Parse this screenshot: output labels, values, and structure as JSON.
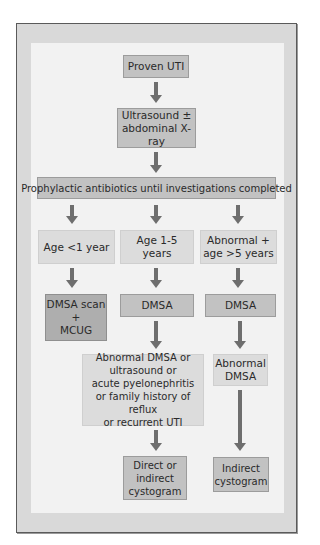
{
  "caption": "",
  "flowchart": {
    "colors": {
      "frame": "#d9d9d9",
      "panel": "#f2f2f2",
      "box_mid": "#c2c2c2",
      "box_light": "#dcdcdc",
      "box_dark": "#aeaeae",
      "arrow": "#6e6e6e"
    },
    "nodes": {
      "proven_uti": "Proven UTI",
      "ultrasound_line1": "Ultrasound ±",
      "ultrasound_line2": "abdominal X-ray",
      "prophylactic": "Prophylactic antibiotics until investigations completed",
      "age_lt1": "Age <1 year",
      "age_1_5": "Age 1-5 years",
      "abnormal_gt5_line1": "Abnormal +",
      "abnormal_gt5_line2": "age >5 years",
      "dmsa_mcug_line1": "DMSA scan",
      "dmsa_mcug_line2": "+",
      "dmsa_mcug_line3": "MCUG",
      "dmsa_mid": "DMSA",
      "dmsa_right": "DMSA",
      "criteria_line1": "Abnormal DMSA or",
      "criteria_line2": "ultrasound or",
      "criteria_line3": "acute pyelonephritis",
      "criteria_line4": "or family history of reflux",
      "criteria_line5": "or recurrent UTI",
      "abnormal_dmsa_line1": "Abnormal",
      "abnormal_dmsa_line2": "DMSA",
      "direct_line1": "Direct or",
      "direct_line2": "indirect",
      "direct_line3": "cystogram",
      "indirect_line1": "Indirect",
      "indirect_line2": "cystogram"
    },
    "edges": [
      [
        "Proven UTI",
        "Ultrasound ± abdominal X-ray"
      ],
      [
        "Ultrasound ± abdominal X-ray",
        "Prophylactic antibiotics until investigations completed"
      ],
      [
        "Prophylactic antibiotics until investigations completed",
        "Age <1 year"
      ],
      [
        "Prophylactic antibiotics until investigations completed",
        "Age 1-5 years"
      ],
      [
        "Prophylactic antibiotics until investigations completed",
        "Abnormal + age >5 years"
      ],
      [
        "Age <1 year",
        "DMSA scan + MCUG"
      ],
      [
        "Age 1-5 years",
        "DMSA"
      ],
      [
        "Abnormal + age >5 years",
        "DMSA"
      ],
      [
        "DMSA (1-5 years)",
        "Abnormal DMSA or ultrasound or acute pyelonephritis or family history of reflux or recurrent UTI"
      ],
      [
        "DMSA (>5 years)",
        "Abnormal DMSA"
      ],
      [
        "Abnormal DMSA or ... recurrent UTI",
        "Direct or indirect cystogram"
      ],
      [
        "Abnormal DMSA",
        "Indirect cystogram"
      ]
    ]
  }
}
